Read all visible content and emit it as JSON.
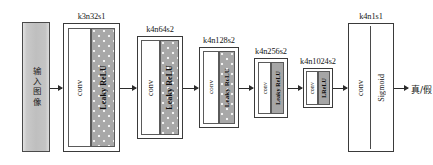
{
  "diagram": {
    "input": {
      "label": "输入图像",
      "name": "input-image"
    },
    "output": {
      "label": "真/假",
      "name": "real-fake-output"
    },
    "conv_label": "conv",
    "stages": [
      {
        "id": "stage-1",
        "label": "k3n32s1",
        "kernel": 3,
        "filters": 32,
        "stride": 1,
        "conv_label": "conv",
        "activation_label": "Leaky ReLU"
      },
      {
        "id": "stage-2",
        "label": "k4n64s2",
        "kernel": 4,
        "filters": 64,
        "stride": 2,
        "conv_label": "conv",
        "activation_label": "Leaky ReLU"
      },
      {
        "id": "stage-3",
        "label": "k4n128s2",
        "kernel": 4,
        "filters": 128,
        "stride": 2,
        "conv_label": "conv",
        "activation_label": "Leaky ReLU"
      },
      {
        "id": "stage-4",
        "label": "k4n256s2",
        "kernel": 4,
        "filters": 256,
        "stride": 2,
        "conv_label": "conv",
        "activation_label": "Leaky ReLU"
      },
      {
        "id": "stage-5",
        "label": "k4n1024s2",
        "kernel": 4,
        "filters": 1024,
        "stride": 2,
        "conv_label": "conv",
        "activation_label": "LReLU"
      },
      {
        "id": "stage-6",
        "label": "k4n1s1",
        "kernel": 4,
        "filters": 1,
        "stride": 1,
        "conv_label": "conv",
        "activation_label": "Sigmoid"
      }
    ],
    "colors": {
      "block_fill": "#ffffff",
      "activation_fill": "#a8a8a8",
      "input_fill": "#c6c6c6",
      "stroke": "#3a3a3a",
      "text": "#161616"
    }
  }
}
